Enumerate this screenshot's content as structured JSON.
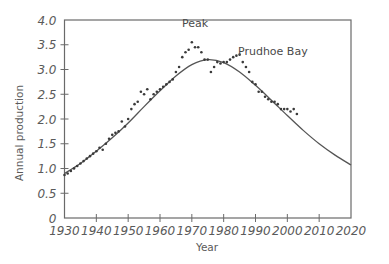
{
  "chart_data": {
    "type": "scatter",
    "title": "",
    "xlabel": "Year",
    "ylabel": "Annual production",
    "xlim": [
      1930,
      2020
    ],
    "ylim": [
      0,
      4.0
    ],
    "grid": false,
    "x_ticks": [
      1930,
      1940,
      1950,
      1960,
      1970,
      1980,
      1990,
      2000,
      2010,
      2020
    ],
    "x_tick_labels": [
      "1930",
      "1940",
      "1950",
      "1960",
      "1970",
      "1980",
      "1990",
      "2000",
      "2010",
      "2020"
    ],
    "y_ticks": [
      0,
      0.5,
      1.0,
      1.5,
      2.0,
      2.5,
      3.0,
      3.5,
      4.0
    ],
    "y_tick_labels": [
      "0",
      "0.5",
      "1.0",
      "1.5",
      "2.0",
      "2.5",
      "3.0",
      "3.5",
      "4.0"
    ],
    "annotations": [
      {
        "text": "Peak",
        "x": 1971,
        "y": 3.85
      },
      {
        "text": "Prudhoe Bay",
        "x": 1984.5,
        "y": 3.3
      }
    ],
    "series": [
      {
        "name": "Actual production",
        "style": "dots",
        "x": [
          1930,
          1931,
          1932,
          1933,
          1934,
          1935,
          1936,
          1937,
          1938,
          1939,
          1940,
          1941,
          1942,
          1943,
          1944,
          1945,
          1946,
          1947,
          1948,
          1949,
          1950,
          1951,
          1952,
          1953,
          1954,
          1955,
          1956,
          1957,
          1958,
          1959,
          1960,
          1961,
          1962,
          1963,
          1964,
          1965,
          1966,
          1967,
          1968,
          1969,
          1970,
          1971,
          1972,
          1973,
          1974,
          1975,
          1976,
          1977,
          1978,
          1979,
          1980,
          1981,
          1982,
          1983,
          1984,
          1985,
          1986,
          1987,
          1988,
          1989,
          1990,
          1991,
          1992,
          1993,
          1994,
          1995,
          1996,
          1997,
          1998,
          1999,
          2000,
          2001,
          2002,
          2003
        ],
        "values": [
          0.87,
          0.9,
          0.95,
          1.0,
          1.05,
          1.1,
          1.15,
          1.2,
          1.25,
          1.3,
          1.35,
          1.42,
          1.38,
          1.5,
          1.6,
          1.68,
          1.72,
          1.75,
          1.95,
          1.85,
          2.0,
          2.2,
          2.3,
          2.35,
          2.55,
          2.5,
          2.6,
          2.4,
          2.5,
          2.55,
          2.6,
          2.65,
          2.7,
          2.75,
          2.8,
          2.95,
          3.05,
          3.25,
          3.35,
          3.4,
          3.55,
          3.45,
          3.45,
          3.35,
          3.2,
          3.2,
          2.95,
          3.05,
          3.15,
          3.12,
          3.15,
          3.15,
          3.2,
          3.25,
          3.28,
          3.3,
          3.15,
          3.05,
          2.95,
          2.75,
          2.7,
          2.55,
          2.55,
          2.45,
          2.4,
          2.35,
          2.35,
          2.3,
          2.2,
          2.2,
          2.2,
          2.15,
          2.2,
          2.1
        ]
      },
      {
        "name": "Hubbert curve",
        "style": "line",
        "x": [
          1930,
          1935,
          1940,
          1945,
          1950,
          1955,
          1960,
          1965,
          1970,
          1975,
          1980,
          1985,
          1990,
          1995,
          2000,
          2005,
          2010,
          2015,
          2020
        ],
        "values": [
          0.9,
          1.1,
          1.35,
          1.62,
          1.92,
          2.25,
          2.57,
          2.87,
          3.1,
          3.2,
          3.14,
          2.95,
          2.68,
          2.38,
          2.07,
          1.77,
          1.5,
          1.27,
          1.07
        ]
      }
    ]
  }
}
